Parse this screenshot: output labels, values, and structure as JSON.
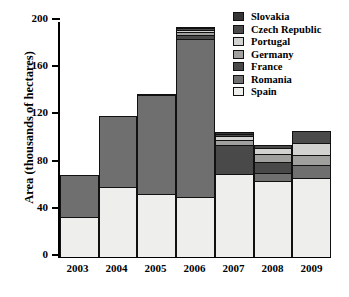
{
  "chart_data": {
    "type": "bar",
    "subtype": "stacked-bar",
    "title": "",
    "xlabel": "",
    "ylabel": "Area (thousands of hectares)",
    "ylim": [
      0,
      200
    ],
    "yticks": [
      0,
      40,
      80,
      120,
      160,
      200
    ],
    "grid": false,
    "legend_position": "top-right",
    "categories": [
      "2003",
      "2004",
      "2005",
      "2006",
      "2007",
      "2008",
      "2009"
    ],
    "series": [
      {
        "name": "Spain",
        "color": "#eeeeec",
        "values": [
          34,
          59,
          53,
          51,
          70,
          64,
          67
        ]
      },
      {
        "name": "Romania",
        "color": "#6f6f6f",
        "values": [
          36,
          61,
          85,
          135,
          0,
          8,
          12
        ]
      },
      {
        "name": "France",
        "color": "#494949",
        "values": [
          0,
          0,
          0,
          4,
          26,
          10,
          0
        ]
      },
      {
        "name": "Germany",
        "color": "#a0a09e",
        "values": [
          0,
          0,
          0,
          3,
          5,
          8,
          9
        ]
      },
      {
        "name": "Portugal",
        "color": "#d2d2d0",
        "values": [
          0,
          0,
          0,
          3,
          4,
          6,
          11
        ]
      },
      {
        "name": "Czech Republic",
        "color": "#4a4a4a",
        "values": [
          0,
          0,
          2,
          2,
          3,
          3,
          11
        ]
      },
      {
        "name": "Slovakia",
        "color": "#363636",
        "values": [
          0,
          0,
          0,
          2,
          2,
          0,
          0
        ]
      }
    ],
    "totals": [
      70,
      120,
      140,
      200,
      110,
      99,
      110
    ],
    "legend_order": [
      "Slovakia",
      "Czech Republic",
      "Portugal",
      "Germany",
      "France",
      "Romania",
      "Spain"
    ]
  }
}
